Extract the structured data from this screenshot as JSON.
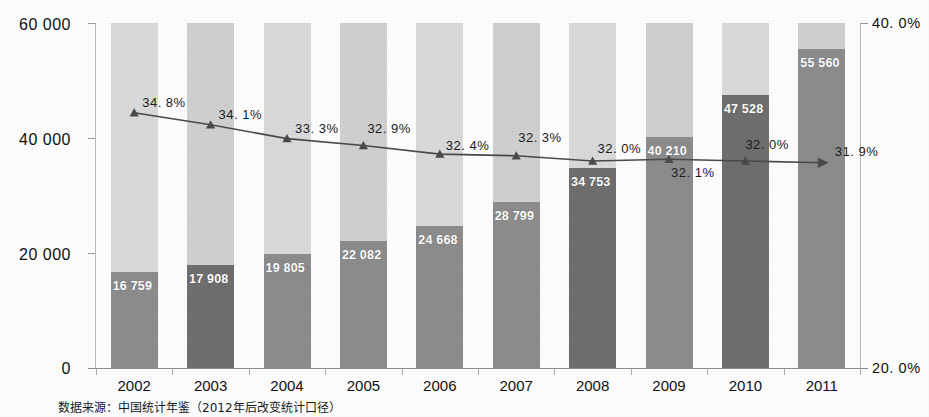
{
  "chart_data": {
    "type": "bar",
    "title": "",
    "subtitle": "",
    "xlabel": "",
    "ylabel": "",
    "categories": [
      "2002",
      "2003",
      "2004",
      "2005",
      "2006",
      "2007",
      "2008",
      "2009",
      "2010",
      "2011"
    ],
    "series": [
      {
        "name": "bars",
        "type": "bar",
        "axis": "left",
        "values": [
          16759,
          17908,
          19805,
          22082,
          24668,
          28799,
          34753,
          40210,
          47528,
          55560
        ],
        "value_labels": [
          "16 759",
          "17 908",
          "19 805",
          "22 082",
          "24 668",
          "28 799",
          "34 753",
          "40 210",
          "47 528",
          "55 560"
        ]
      },
      {
        "name": "line",
        "type": "line",
        "axis": "right",
        "values": [
          34.8,
          34.1,
          33.3,
          32.9,
          32.4,
          32.3,
          32.0,
          32.1,
          32.0,
          31.9
        ],
        "value_labels": [
          "34. 8%",
          "34. 1%",
          "33. 3%",
          "32. 9%",
          "32. 4%",
          "32. 3%",
          "32. 0%",
          "32. 1%",
          "32. 0%",
          "31. 9%"
        ]
      }
    ],
    "left_axis": {
      "ticks": [
        0,
        20000,
        40000,
        60000
      ],
      "tick_labels": [
        "0",
        "20 000",
        "40 000",
        "60 000"
      ],
      "ylim": [
        0,
        60000
      ]
    },
    "right_axis": {
      "ticks": [
        20.0,
        40.0
      ],
      "tick_labels": [
        "20. 0%",
        "40. 0%"
      ],
      "ylim": [
        20.0,
        40.0
      ]
    },
    "grid": false,
    "legend": "none",
    "colors": {
      "band_light": "#d9d9d9",
      "band_dark": "#cfcfcf",
      "bar": "#8c8c8c",
      "bar_dark": "#6e6e6e",
      "bar_darker": "#5a5a5a",
      "line": "#4a4a4a",
      "bar_label_text": "#ffffff",
      "axis_text": "#111111"
    }
  },
  "source_note": "数据来源：中国统计年鉴（2012年后改变统计口径）"
}
